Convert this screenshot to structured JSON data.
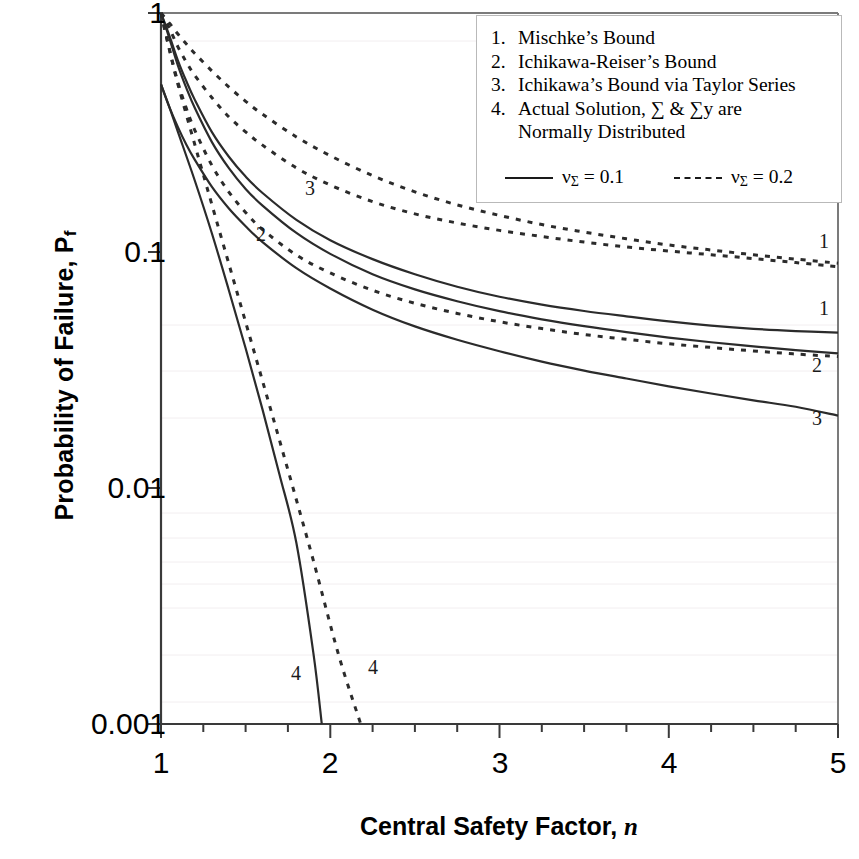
{
  "axes": {
    "y_title_main": "Probability of Failure, P",
    "y_title_sub": "f",
    "x_title_main": "Central Safety Factor, ",
    "x_title_var": "n",
    "y_ticks": [
      "1",
      "0.1",
      "0.01",
      "0.001"
    ],
    "x_ticks": [
      "1",
      "2",
      "3",
      "4",
      "5"
    ]
  },
  "legend": {
    "items": [
      {
        "num": "1.",
        "line1": "Mischke’s Bound",
        "line2": ""
      },
      {
        "num": "2.",
        "line1": "Ichikawa-Reiser’s Bound",
        "line2": ""
      },
      {
        "num": "3.",
        "line1": "Ichikawa’s Bound via Taylor Series",
        "line2": ""
      },
      {
        "num": "4.",
        "line1": "Actual Solution, ∑ & ∑y are",
        "line2": "Normally Distributed"
      }
    ],
    "key_solid_main": "ν",
    "key_solid_sub": "Σ",
    "key_solid_val": " = 0.1",
    "key_dash_main": "ν",
    "key_dash_sub": "Σ",
    "key_dash_val": " = 0.2"
  },
  "curve_labels": {
    "inline_3": "3",
    "inline_2": "2",
    "inline_4_solid": "4",
    "inline_4_dash": "4",
    "right_1_dash": "1",
    "right_1_solid": "1",
    "right_2_dash": "2",
    "right_3_solid": "3"
  },
  "chart_data": {
    "type": "line",
    "title": "",
    "xlabel": "Central Safety Factor, n",
    "ylabel": "Probability of Failure, Pf",
    "xlim": [
      1,
      5
    ],
    "ylim": [
      0.001,
      1
    ],
    "yscale": "log",
    "xscale": "linear",
    "grid": false,
    "legend_position": "top-right",
    "x": [
      1.0,
      1.05,
      1.1,
      1.15,
      1.2,
      1.3,
      1.4,
      1.5,
      1.6,
      1.8,
      2.0,
      2.25,
      2.5,
      2.75,
      3.0,
      3.25,
      3.5,
      3.75,
      4.0,
      4.25,
      4.5,
      4.75,
      5.0
    ],
    "series": [
      {
        "name": "Mischke's Bound, nu_Sigma = 0.2",
        "id": "1-dash",
        "style": "dashed",
        "label": "1",
        "values": [
          1.0,
          0.86,
          0.72,
          0.62,
          0.545,
          0.44,
          0.365,
          0.315,
          0.277,
          0.222,
          0.188,
          0.16,
          0.142,
          0.13,
          0.121,
          0.114,
          0.108,
          0.103,
          0.099,
          0.0955,
          0.092,
          0.0885,
          0.085
        ]
      },
      {
        "name": "Mischke's Bound, nu_Sigma = 0.1",
        "id": "1-solid",
        "style": "solid",
        "label": "1",
        "values": [
          1.0,
          0.8,
          0.63,
          0.515,
          0.43,
          0.315,
          0.248,
          0.204,
          0.174,
          0.134,
          0.11,
          0.0915,
          0.079,
          0.07,
          0.0635,
          0.0588,
          0.0553,
          0.0525,
          0.05,
          0.048,
          0.0465,
          0.0455,
          0.0448
        ]
      },
      {
        "name": "Ichikawa-Reiser's Bound, nu_Sigma = 0.2",
        "id": "2-dash",
        "style": "dashed",
        "label": "2",
        "values": [
          1.0,
          0.7,
          0.51,
          0.395,
          0.32,
          0.228,
          0.176,
          0.144,
          0.122,
          0.0952,
          0.08,
          0.0676,
          0.0596,
          0.054,
          0.0498,
          0.0466,
          0.044,
          0.042,
          0.0402,
          0.0388,
          0.0375,
          0.0364,
          0.0355
        ]
      },
      {
        "name": "Ichikawa-Reiser's Bound, nu_Sigma = 0.1",
        "id": "2-solid",
        "style": "solid",
        "label": "2",
        "values": [
          1.0,
          0.78,
          0.6,
          0.482,
          0.397,
          0.286,
          0.222,
          0.181,
          0.154,
          0.118,
          0.0963,
          0.079,
          0.0682,
          0.0608,
          0.0552,
          0.051,
          0.0477,
          0.045,
          0.0427,
          0.0408,
          0.0392,
          0.0378,
          0.0366
        ]
      },
      {
        "name": "Ichikawa's Bound via Taylor Series, nu_Sigma = 0.1",
        "id": "3-solid",
        "style": "solid",
        "label": "3",
        "values": [
          0.5,
          0.4,
          0.33,
          0.278,
          0.24,
          0.185,
          0.15,
          0.126,
          0.108,
          0.0838,
          0.0688,
          0.056,
          0.0476,
          0.0418,
          0.0374,
          0.0338,
          0.031,
          0.0287,
          0.0266,
          0.0248,
          0.0232,
          0.0218,
          0.02
        ]
      },
      {
        "name": "Ichikawa's Bound via Taylor Series, nu_Sigma = 0.2",
        "id": "3-dash",
        "style": "dashed",
        "label": "3",
        "values": [
          1.0,
          0.905,
          0.815,
          0.74,
          0.675,
          0.57,
          0.488,
          0.424,
          0.374,
          0.3,
          0.25,
          0.206,
          0.176,
          0.155,
          0.14,
          0.128,
          0.119,
          0.1115,
          0.105,
          0.1,
          0.0955,
          0.0915,
          0.088
        ]
      },
      {
        "name": "Actual Solution, nu_Sigma = 0.1",
        "id": "4-solid",
        "style": "solid",
        "label": "4",
        "x": [
          1.0,
          1.05,
          1.1,
          1.2,
          1.3,
          1.4,
          1.5,
          1.6,
          1.7,
          1.8,
          1.9,
          1.95
        ],
        "values": [
          0.5,
          0.4,
          0.315,
          0.196,
          0.118,
          0.068,
          0.0385,
          0.0212,
          0.0113,
          0.0058,
          0.002,
          0.001
        ]
      },
      {
        "name": "Actual Solution, nu_Sigma = 0.2",
        "id": "4-dash",
        "style": "dashed",
        "label": "4",
        "x": [
          1.0,
          1.05,
          1.1,
          1.2,
          1.3,
          1.45,
          1.6,
          1.75,
          1.9,
          2.05,
          2.18
        ],
        "values": [
          1.0,
          0.7,
          0.5,
          0.278,
          0.156,
          0.066,
          0.028,
          0.0118,
          0.0049,
          0.00195,
          0.001
        ]
      }
    ]
  }
}
